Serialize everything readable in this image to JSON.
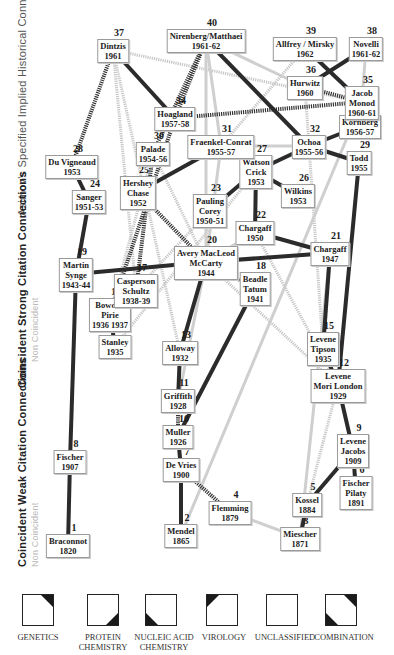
{
  "axis_labels": [
    {
      "id": "historical",
      "x": 28,
      "y": 215,
      "parts": [
        {
          "text": "Asimov's ",
          "style": "faint-dark"
        },
        {
          "text": "Specified / Implied ",
          "style": "faint-dark"
        },
        {
          "text": "Historical Connections",
          "style": "faint-dark"
        }
      ]
    },
    {
      "id": "strong",
      "x": 28,
      "y": 385,
      "parts": [
        {
          "text": "Coincident ",
          "style": "strong"
        },
        {
          "text": "Strong Citation Connections",
          "style": "faint"
        }
      ]
    },
    {
      "id": "strong-sub",
      "x": 40,
      "y": 375,
      "parts": [
        {
          "text": "Non Coincident",
          "style": "faint"
        }
      ]
    },
    {
      "id": "weak",
      "x": 28,
      "y": 565,
      "parts": [
        {
          "text": "Coincident ",
          "style": "strong"
        },
        {
          "text": "Weak Citation Connections",
          "style": "faint"
        }
      ]
    },
    {
      "id": "weak-sub",
      "x": 40,
      "y": 565,
      "parts": [
        {
          "text": "Non Coincident",
          "style": "faint"
        }
      ]
    }
  ],
  "axis_text": {
    "historical": "Asimov's Specified Implied Historical Connections",
    "strong": "Coincident Strong Citation Connections",
    "strong_sub": "Non Coincident",
    "weak": "Coincident Weak Citation Connections",
    "weak_sub": "Non Coincident"
  },
  "nodes": [
    {
      "id": "1",
      "lines": [
        "Braconnot",
        "1820"
      ],
      "x": 68,
      "y": 545
    },
    {
      "id": "2",
      "lines": [
        "Mendel",
        "1865"
      ],
      "x": 181,
      "y": 535
    },
    {
      "id": "3",
      "lines": [
        "Miescher",
        "1871"
      ],
      "x": 300,
      "y": 538
    },
    {
      "id": "4",
      "lines": [
        "Flemming",
        "1879"
      ],
      "x": 230,
      "y": 512
    },
    {
      "id": "5",
      "lines": [
        "Kossel",
        "1884"
      ],
      "x": 307,
      "y": 504
    },
    {
      "id": "6",
      "lines": [
        "Fischer",
        "Pilaty",
        "1891"
      ],
      "x": 356,
      "y": 492
    },
    {
      "id": "7",
      "lines": [
        "De Vries",
        "1900"
      ],
      "x": 181,
      "y": 469
    },
    {
      "id": "8",
      "lines": [
        "Fischer",
        "1907"
      ],
      "x": 70,
      "y": 461
    },
    {
      "id": "9",
      "lines": [
        "Levene",
        "Jacobs",
        "1909"
      ],
      "x": 353,
      "y": 450
    },
    {
      "id": "10",
      "lines": [
        "Muller",
        "1926"
      ],
      "x": 178,
      "y": 436
    },
    {
      "id": "11",
      "lines": [
        "Griffith",
        "1928"
      ],
      "x": 178,
      "y": 400
    },
    {
      "id": "12",
      "lines": [
        "Levene",
        "Mori  London",
        "1929"
      ],
      "x": 338,
      "y": 385
    },
    {
      "id": "13",
      "lines": [
        "Alloway",
        "1932"
      ],
      "x": 180,
      "y": 352
    },
    {
      "id": "14",
      "lines": [
        "Stanley",
        "1935"
      ],
      "x": 115,
      "y": 346
    },
    {
      "id": "15",
      "lines": [
        "Levene",
        "Tipson",
        "1935"
      ],
      "x": 323,
      "y": 348
    },
    {
      "id": "16",
      "lines": [
        "Bowden",
        "Pirie",
        "1936  1937"
      ],
      "x": 110,
      "y": 314
    },
    {
      "id": "17",
      "lines": [
        "Casperson",
        "Schultz",
        "1938-39"
      ],
      "x": 136,
      "y": 290
    },
    {
      "id": "18",
      "lines": [
        "Beadle",
        "Tatum",
        "1941"
      ],
      "x": 255,
      "y": 288
    },
    {
      "id": "19",
      "lines": [
        "Martin",
        "Synge",
        "1943-44"
      ],
      "x": 76,
      "y": 274
    },
    {
      "id": "20",
      "lines": [
        "Avery MacLeod",
        "McCarty",
        "1944"
      ],
      "x": 206,
      "y": 262
    },
    {
      "id": "21",
      "lines": [
        "Chargaff",
        "1947"
      ],
      "x": 330,
      "y": 253
    },
    {
      "id": "22",
      "lines": [
        "Chargaff",
        "1950"
      ],
      "x": 255,
      "y": 232
    },
    {
      "id": "23",
      "lines": [
        "Pauling",
        "Corey",
        "1950-51"
      ],
      "x": 210,
      "y": 210
    },
    {
      "id": "24",
      "lines": [
        "Sanger",
        "1951-53"
      ],
      "x": 89,
      "y": 201
    },
    {
      "id": "25",
      "lines": [
        "Hershey",
        "Chase",
        "1952"
      ],
      "x": 138,
      "y": 192
    },
    {
      "id": "26",
      "lines": [
        "Wilkins",
        "1953"
      ],
      "x": 298,
      "y": 195
    },
    {
      "id": "27",
      "lines": [
        "Watson",
        "Crick",
        "1953"
      ],
      "x": 256,
      "y": 171
    },
    {
      "id": "28",
      "lines": [
        "Du Vigneaud",
        "1953"
      ],
      "x": 72,
      "y": 166
    },
    {
      "id": "29",
      "lines": [
        "Todd",
        "1955"
      ],
      "x": 359,
      "y": 162
    },
    {
      "id": "30",
      "lines": [
        "Palade",
        "1954-56"
      ],
      "x": 153,
      "y": 153
    },
    {
      "id": "31",
      "lines": [
        "Fraenkel-Conrat",
        "1955-57"
      ],
      "x": 221,
      "y": 146
    },
    {
      "id": "32",
      "lines": [
        "Ochoa",
        "1955-56"
      ],
      "x": 309,
      "y": 146
    },
    {
      "id": "33",
      "lines": [
        "Kornberg",
        "1956-57"
      ],
      "x": 360,
      "y": 126
    },
    {
      "id": "34",
      "lines": [
        "Hoagland",
        "1957-58"
      ],
      "x": 175,
      "y": 118
    },
    {
      "id": "35",
      "lines": [
        "Jacob",
        "Monod",
        "1960-61"
      ],
      "x": 362,
      "y": 102
    },
    {
      "id": "36",
      "lines": [
        "Hurwitz",
        "1960"
      ],
      "x": 305,
      "y": 87
    },
    {
      "id": "37",
      "lines": [
        "Dintzis",
        "1961"
      ],
      "x": 113,
      "y": 50
    },
    {
      "id": "38",
      "lines": [
        "Novelli",
        "1961-62"
      ],
      "x": 366,
      "y": 48
    },
    {
      "id": "39",
      "lines": [
        "Allfrey / Mirsky",
        "1962"
      ],
      "x": 305,
      "y": 48
    },
    {
      "id": "40",
      "lines": [
        "Nirenberg/Matthaei",
        "1961-62"
      ],
      "x": 206,
      "y": 40
    }
  ],
  "edges": [
    {
      "from": "1",
      "to": "8",
      "type": "strong"
    },
    {
      "from": "8",
      "to": "19",
      "type": "strong"
    },
    {
      "from": "19",
      "to": "24",
      "type": "strong"
    },
    {
      "from": "24",
      "to": "28",
      "type": "strong"
    },
    {
      "from": "28",
      "to": "37",
      "type": "specified"
    },
    {
      "from": "19",
      "to": "20",
      "type": "strong"
    },
    {
      "from": "2",
      "to": "7",
      "type": "strong"
    },
    {
      "from": "7",
      "to": "10",
      "type": "strong"
    },
    {
      "from": "10",
      "to": "11",
      "type": "specified"
    },
    {
      "from": "11",
      "to": "13",
      "type": "strong"
    },
    {
      "from": "13",
      "to": "20",
      "type": "strong"
    },
    {
      "from": "7",
      "to": "4",
      "type": "specified"
    },
    {
      "from": "4",
      "to": "3",
      "type": "weak"
    },
    {
      "from": "3",
      "to": "5",
      "type": "strong"
    },
    {
      "from": "5",
      "to": "9",
      "type": "strong"
    },
    {
      "from": "9",
      "to": "6",
      "type": "strong"
    },
    {
      "from": "9",
      "to": "12",
      "type": "strong"
    },
    {
      "from": "12",
      "to": "15",
      "type": "strong"
    },
    {
      "from": "15",
      "to": "21",
      "type": "strong"
    },
    {
      "from": "12",
      "to": "29",
      "type": "strong"
    },
    {
      "from": "21",
      "to": "20",
      "type": "strong"
    },
    {
      "from": "21",
      "to": "22",
      "type": "strong"
    },
    {
      "from": "22",
      "to": "27",
      "type": "strong"
    },
    {
      "from": "23",
      "to": "27",
      "type": "strong"
    },
    {
      "from": "26",
      "to": "27",
      "type": "strong"
    },
    {
      "from": "27",
      "to": "32",
      "type": "strong"
    },
    {
      "from": "32",
      "to": "29",
      "type": "strong"
    },
    {
      "from": "32",
      "to": "33",
      "type": "strong"
    },
    {
      "from": "32",
      "to": "40",
      "type": "strong"
    },
    {
      "from": "36",
      "to": "35",
      "type": "specified"
    },
    {
      "from": "38",
      "to": "36",
      "type": "strong"
    },
    {
      "from": "39",
      "to": "35",
      "type": "strong"
    },
    {
      "from": "37",
      "to": "34",
      "type": "strong"
    },
    {
      "from": "40",
      "to": "34",
      "type": "specified"
    },
    {
      "from": "40",
      "to": "30",
      "type": "specified"
    },
    {
      "from": "34",
      "to": "35",
      "type": "specified"
    },
    {
      "from": "25",
      "to": "31",
      "type": "strong"
    },
    {
      "from": "18",
      "to": "10",
      "type": "strong"
    },
    {
      "from": "20",
      "to": "18",
      "type": "specified"
    },
    {
      "from": "16",
      "to": "14",
      "type": "strong"
    },
    {
      "from": "30",
      "to": "17",
      "type": "specified"
    },
    {
      "from": "34",
      "to": "16",
      "type": "specified"
    },
    {
      "from": "25",
      "to": "20",
      "type": "specified"
    },
    {
      "from": "40",
      "to": "36",
      "type": "weak"
    },
    {
      "from": "31",
      "to": "32",
      "type": "weak"
    },
    {
      "from": "31",
      "to": "20",
      "type": "weak"
    },
    {
      "from": "22",
      "to": "20",
      "type": "weak"
    },
    {
      "from": "36",
      "to": "32",
      "type": "implied"
    },
    {
      "from": "39",
      "to": "31",
      "type": "implied"
    },
    {
      "from": "38",
      "to": "33",
      "type": "weak"
    },
    {
      "from": "40",
      "to": "20",
      "type": "weak"
    },
    {
      "from": "20",
      "to": "11",
      "type": "weak"
    },
    {
      "from": "21",
      "to": "3",
      "type": "weak"
    },
    {
      "from": "12",
      "to": "5",
      "type": "implied"
    },
    {
      "from": "20",
      "to": "12",
      "type": "implied"
    },
    {
      "from": "37",
      "to": "13",
      "type": "implied"
    },
    {
      "from": "37",
      "to": "17",
      "type": "implied"
    },
    {
      "from": "30",
      "to": "20",
      "type": "implied"
    },
    {
      "from": "40",
      "to": "31",
      "type": "weak"
    },
    {
      "from": "32",
      "to": "15",
      "type": "implied"
    },
    {
      "from": "35",
      "to": "2",
      "type": "weak"
    },
    {
      "from": "22",
      "to": "12",
      "type": "implied"
    },
    {
      "from": "37",
      "to": "35",
      "type": "implied"
    },
    {
      "from": "17",
      "to": "23",
      "type": "implied"
    },
    {
      "from": "14",
      "to": "27",
      "type": "implied"
    },
    {
      "from": "16",
      "to": "30",
      "type": "implied"
    }
  ],
  "edge_styles": {
    "strong": {
      "color": "#2b2b2b",
      "width": 4,
      "dash": ""
    },
    "specified": {
      "color": "#333333",
      "width": 4,
      "dash": "1.2 1"
    },
    "weak": {
      "color": "#cfcfcf",
      "width": 3,
      "dash": ""
    },
    "implied": {
      "color": "#c6c6c6",
      "width": 3,
      "dash": "1.2 1"
    }
  },
  "legend": {
    "items": [
      {
        "id": "genetics",
        "label_lines": [
          "GENETICS"
        ],
        "corners": [
          "tr"
        ],
        "x": 22,
        "label_x": 38
      },
      {
        "id": "protein",
        "label_lines": [
          "PROTEIN",
          "CHEMISTRY"
        ],
        "corners": [
          "br"
        ],
        "x": 87,
        "label_x": 103
      },
      {
        "id": "nucleic",
        "label_lines": [
          "NUCLEIC ACID",
          "CHEMISTRY"
        ],
        "corners": [
          "bl"
        ],
        "x": 145,
        "label_x": 164
      },
      {
        "id": "virology",
        "label_lines": [
          "VIROLOGY"
        ],
        "corners": [
          "tl"
        ],
        "x": 206,
        "label_x": 224
      },
      {
        "id": "unclassified",
        "label_lines": [
          "UNCLASSIFIED"
        ],
        "corners": [],
        "x": 266,
        "label_x": 285
      },
      {
        "id": "combination",
        "label_lines": [
          "COMBINATION"
        ],
        "corners": [
          "tr",
          "bl"
        ],
        "x": 325,
        "label_x": 344
      }
    ],
    "corner_color": "#1a1a1a"
  }
}
